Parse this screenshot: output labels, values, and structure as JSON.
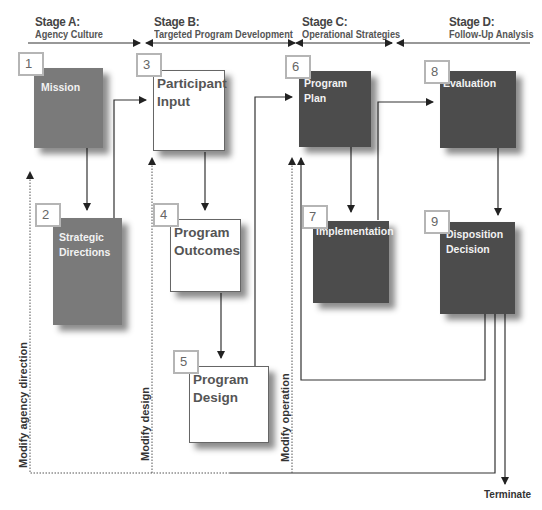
{
  "stages": [
    {
      "id": "A",
      "title": "Stage A:",
      "subtitle": "Agency Culture"
    },
    {
      "id": "B",
      "title": "Stage B:",
      "subtitle": "Targeted Program Development"
    },
    {
      "id": "C",
      "title": "Stage C:",
      "subtitle": "Operational Strategies"
    },
    {
      "id": "D",
      "title": "Stage D:",
      "subtitle": "Follow-Up Analysis"
    }
  ],
  "boxes": [
    {
      "number": "1",
      "label": "Mission",
      "stage": "A",
      "style": "gray"
    },
    {
      "number": "2",
      "label": "Strategic Directions",
      "stage": "A",
      "style": "gray"
    },
    {
      "number": "3",
      "label": "Participant Input",
      "stage": "B",
      "style": "white"
    },
    {
      "number": "4",
      "label": "Program Outcomes",
      "stage": "B",
      "style": "white"
    },
    {
      "number": "5",
      "label": "Program Design",
      "stage": "B",
      "style": "white"
    },
    {
      "number": "6",
      "label": "Program Plan",
      "stage": "C",
      "style": "dark"
    },
    {
      "number": "7",
      "label": "Implementation",
      "stage": "C",
      "style": "dark"
    },
    {
      "number": "8",
      "label": "Evaluation",
      "stage": "D",
      "style": "dark"
    },
    {
      "number": "9",
      "label": "Disposition Decision",
      "stage": "D",
      "style": "dark"
    }
  ],
  "feedback_labels": {
    "modify_agency": "Modify agency direction",
    "modify_design": "Modify design",
    "modify_operation": "Modify operation",
    "terminate": "Terminate"
  },
  "colors": {
    "gray_box": "#7a7a7a",
    "dark_box": "#4c4c4c",
    "number_border": "#b5b5b5",
    "line": "#333333"
  }
}
